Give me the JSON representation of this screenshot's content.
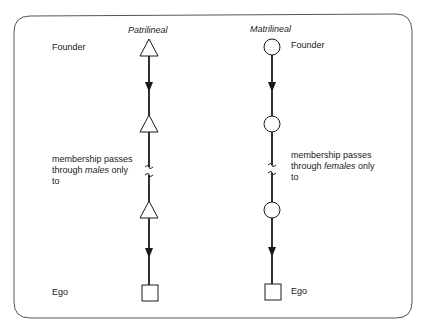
{
  "columns": {
    "patrilineal": {
      "title": "Patrilineal",
      "symbol": "triangle",
      "founder_label": "Founder",
      "description_line1": "membership passes",
      "description_line2_pre": "through ",
      "description_line2_em": "males",
      "description_line2_post": " only",
      "description_line3": "to",
      "ego_label": "Ego"
    },
    "matrilineal": {
      "title": "Matrilineal",
      "symbol": "circle",
      "founder_label": "Founder",
      "description_line1": "membership passes",
      "description_line2_pre": "through ",
      "description_line2_em": "females",
      "description_line2_post": " only",
      "description_line3": "to",
      "ego_label": "Ego"
    }
  },
  "colors": {
    "stroke": "#1a1a1a",
    "frame": "#555555",
    "background": "#ffffff"
  }
}
